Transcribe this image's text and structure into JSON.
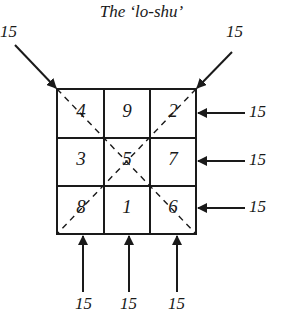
{
  "title": "The ‘lo-shu’",
  "grid": {
    "rows": [
      [
        "4",
        "9",
        "2"
      ],
      [
        "3",
        "5",
        "7"
      ],
      [
        "8",
        "1",
        "6"
      ]
    ]
  },
  "sums": {
    "diagonal_left": "15",
    "diagonal_right": "15",
    "rows": [
      "15",
      "15",
      "15"
    ],
    "columns": [
      "15",
      "15",
      "15"
    ]
  }
}
